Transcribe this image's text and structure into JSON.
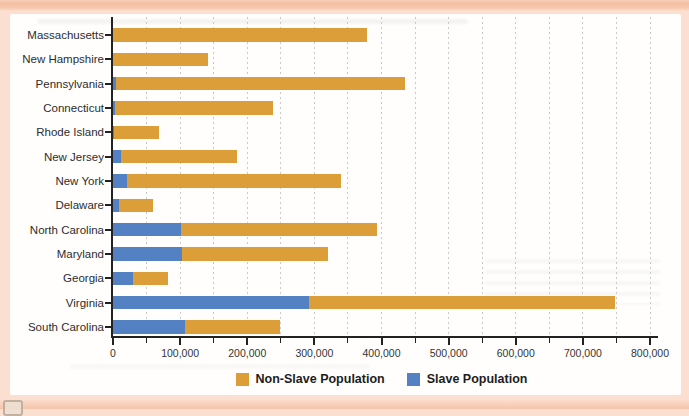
{
  "page": {
    "background_color": "#fbdfd0",
    "top_strip_color": "#f4bfa1",
    "bottom_strip_color": "#f5c4a9",
    "panel_color": "#fffefd"
  },
  "chart_data": {
    "type": "bar",
    "orientation": "horizontal",
    "stacked": true,
    "title": "",
    "xlabel": "",
    "ylabel": "",
    "categories": [
      "Massachusetts",
      "New Hampshire",
      "Pennsylvania",
      "Connecticut",
      "Rhode Island",
      "New Jersey",
      "New York",
      "Delaware",
      "North Carolina",
      "Maryland",
      "Georgia",
      "Virginia",
      "South Carolina"
    ],
    "series": [
      {
        "name": "Slave Population",
        "color": "#5480c4",
        "values": [
          0,
          158,
          3737,
          2764,
          948,
          11423,
          21324,
          8887,
          100572,
          103036,
          29264,
          292627,
          107094
        ]
      },
      {
        "name": "Non-Slave Population",
        "color": "#dc9e38",
        "values": [
          378787,
          141727,
          430636,
          235182,
          67877,
          172716,
          318796,
          50207,
          293179,
          216692,
          53284,
          454983,
          141979
        ]
      }
    ],
    "stack_order": [
      "Slave Population",
      "Non-Slave Population"
    ],
    "xlim": [
      0,
      800000
    ],
    "x_tick_step": 100000,
    "x_minor_tick_step": 50000,
    "x_tick_labels": [
      "0",
      "100,000",
      "200,000",
      "300,000",
      "400,000",
      "500,000",
      "600,000",
      "700,000",
      "800,000"
    ],
    "grid": "vertical dotted gridlines every 50,000",
    "gridline_color": "#c9c9c9",
    "axis_color": "#222222",
    "legend_position": "bottom",
    "legend": [
      {
        "label": "Non-Slave Population",
        "color": "#dc9e38"
      },
      {
        "label": "Slave Population",
        "color": "#5480c4"
      }
    ]
  }
}
